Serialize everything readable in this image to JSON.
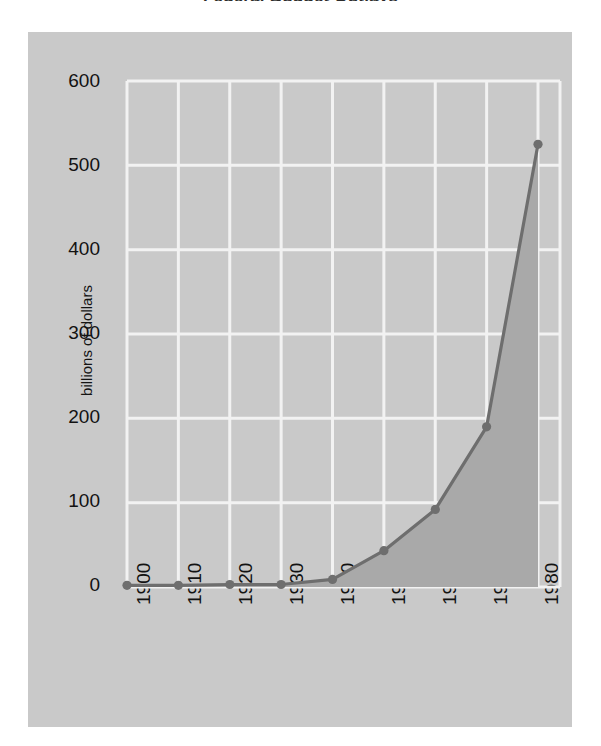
{
  "chart_data": {
    "type": "area",
    "title": "Federal Budget Outlays",
    "xlabel": "",
    "ylabel": "billions of dollars",
    "x": [
      1900,
      1910,
      1920,
      1930,
      1940,
      1950,
      1960,
      1970,
      1980
    ],
    "categories": [
      "1900",
      "1910",
      "1920",
      "1930",
      "1940",
      "1950",
      "1960",
      "1970",
      "1980"
    ],
    "values": [
      2,
      2,
      3,
      3,
      9,
      43,
      92,
      190,
      525
    ],
    "series": [
      {
        "name": "billions of dollars",
        "values": [
          2,
          2,
          3,
          3,
          9,
          43,
          92,
          190,
          525
        ]
      }
    ],
    "yticks": [
      0,
      100,
      200,
      300,
      400,
      500,
      600
    ],
    "ytick_labels": [
      "0",
      "100",
      "200",
      "300",
      "400",
      "500",
      "600"
    ],
    "xticks": [
      1900,
      1910,
      1920,
      1930,
      1940,
      1950,
      1960,
      1970,
      1980
    ],
    "ylim": [
      0,
      600
    ],
    "xlim": [
      1900,
      1980
    ],
    "grid": true,
    "legend": false,
    "legend_position": "none",
    "markers": true,
    "colors": {
      "panel_background": "#c9c9c9",
      "plot_background": "#c9c9c9",
      "gridline": "#f2f2f2",
      "line": "#6e6e6e",
      "fill": "#a9a9a9",
      "marker": "#6e6e6e",
      "text": "#121212",
      "page_background": "#ffffff"
    }
  }
}
